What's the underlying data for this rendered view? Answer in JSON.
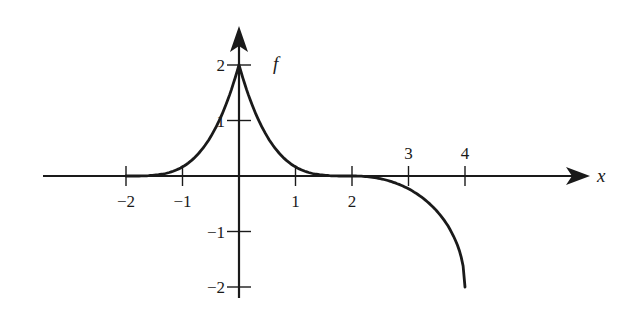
{
  "chart_data": {
    "type": "line",
    "title": "",
    "xlabel": "x",
    "ylabel": "f",
    "xlim": [
      -3.5,
      6.2
    ],
    "ylim": [
      -2.2,
      2.65
    ],
    "grid": false,
    "x_ticks": [
      {
        "value": -2,
        "label": "−2",
        "label_side": "below"
      },
      {
        "value": -1,
        "label": "−1",
        "label_side": "below"
      },
      {
        "value": 1,
        "label": "1",
        "label_side": "below"
      },
      {
        "value": 2,
        "label": "2",
        "label_side": "below"
      },
      {
        "value": 3,
        "label": "3",
        "label_side": "above"
      },
      {
        "value": 4,
        "label": "4",
        "label_side": "above"
      }
    ],
    "y_ticks": [
      {
        "value": 2,
        "label": "2"
      },
      {
        "value": 1,
        "label": "1"
      },
      {
        "value": -1,
        "label": "−1"
      },
      {
        "value": -2,
        "label": "−2"
      }
    ],
    "series": [
      {
        "name": "f",
        "description": "Cusp at (0,2); decays to 0 with horizontal tangent at x=±2; for 2<x<=4 decreases to -2 with vertical tangent at x=4",
        "points": [
          [
            -2,
            0
          ],
          [
            -1.75,
            0.016
          ],
          [
            -1.5,
            0.06
          ],
          [
            -1.25,
            0.14
          ],
          [
            -1,
            0.25
          ],
          [
            -0.75,
            0.39
          ],
          [
            -0.5,
            0.56
          ],
          [
            -0.25,
            0.77
          ],
          [
            -0.1,
            0.95
          ],
          [
            0,
            2
          ],
          [
            0.1,
            0.95
          ],
          [
            0.25,
            0.77
          ],
          [
            0.5,
            0.56
          ],
          [
            0.75,
            0.39
          ],
          [
            1,
            0.25
          ],
          [
            1.25,
            0.14
          ],
          [
            1.5,
            0.06
          ],
          [
            1.75,
            0.016
          ],
          [
            2,
            0
          ],
          [
            2.25,
            -0.03
          ],
          [
            2.5,
            -0.13
          ],
          [
            2.75,
            -0.29
          ],
          [
            3,
            -0.52
          ],
          [
            3.25,
            -0.79
          ],
          [
            3.5,
            -1.1
          ],
          [
            3.75,
            -1.45
          ],
          [
            3.9,
            -1.7
          ],
          [
            4,
            -2
          ]
        ]
      }
    ]
  }
}
